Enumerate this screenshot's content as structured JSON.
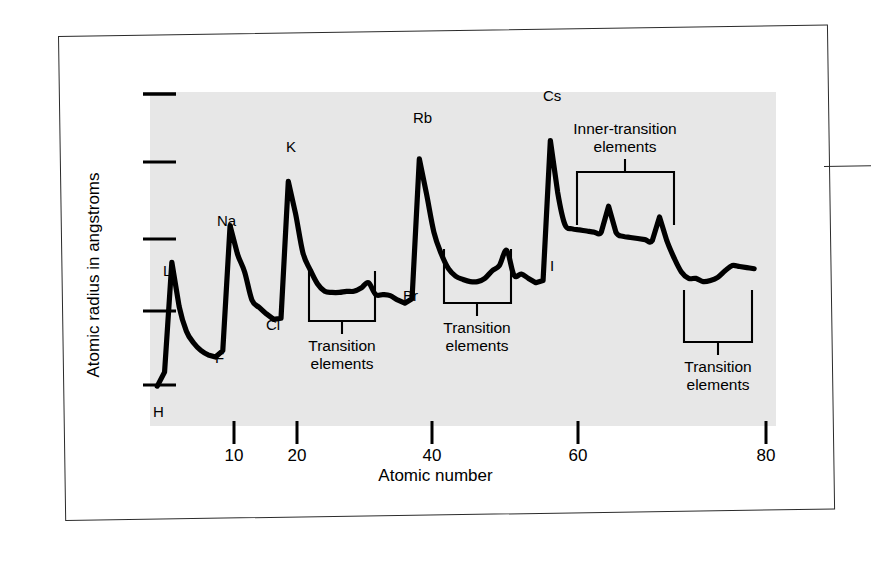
{
  "figure": {
    "y_axis_title": "Atomic radius in angstroms",
    "x_axis_title": "Atomic number",
    "plot_background_color": "#e7e7e7",
    "curve_color": "#000000",
    "frame_color": "#2b2b2b"
  },
  "chart_data": {
    "type": "line",
    "title": "",
    "subtitle": "",
    "xlabel": "Atomic number",
    "ylabel": "Atomic radius in angstroms",
    "xlim": [
      0,
      86
    ],
    "ylim": [
      0,
      3.1
    ],
    "grid": false,
    "legend": null,
    "x_ticks": [
      10,
      20,
      40,
      60,
      80
    ],
    "x_tick_labels": [
      "10",
      "20",
      "40",
      "60",
      "80"
    ],
    "y_ticks": [
      0.5,
      1.0,
      1.5,
      2.0,
      2.5
    ],
    "y_tick_labels": [
      "",
      "",
      "",
      "",
      ""
    ],
    "series": [
      {
        "name": "Atomic radius",
        "x": [
          1,
          2,
          3,
          4,
          5,
          6,
          7,
          8,
          9,
          10,
          11,
          12,
          13,
          14,
          15,
          16,
          17,
          18,
          19,
          20,
          21,
          22,
          23,
          24,
          25,
          26,
          27,
          28,
          29,
          30,
          31,
          32,
          33,
          34,
          35,
          36,
          37,
          38,
          39,
          40,
          41,
          42,
          43,
          44,
          45,
          46,
          47,
          48,
          49,
          50,
          51,
          52,
          53,
          54,
          55,
          56,
          57,
          58,
          59,
          60,
          61,
          62,
          63,
          64,
          65,
          66,
          67,
          68,
          69,
          70,
          71,
          72,
          73,
          74,
          75,
          76,
          77,
          78,
          79,
          80,
          81,
          82,
          83
        ],
        "y": [
          0.37,
          0.5,
          1.52,
          1.11,
          0.88,
          0.77,
          0.7,
          0.66,
          0.64,
          0.7,
          1.86,
          1.6,
          1.43,
          1.17,
          1.1,
          1.04,
          0.99,
          1.0,
          2.27,
          1.97,
          1.61,
          1.45,
          1.32,
          1.25,
          1.24,
          1.24,
          1.25,
          1.25,
          1.28,
          1.33,
          1.22,
          1.22,
          1.21,
          1.17,
          1.14,
          1.18,
          2.48,
          2.15,
          1.8,
          1.6,
          1.46,
          1.39,
          1.36,
          1.34,
          1.34,
          1.37,
          1.44,
          1.49,
          1.63,
          1.4,
          1.41,
          1.37,
          1.33,
          1.35,
          2.65,
          2.17,
          1.87,
          1.83,
          1.82,
          1.81,
          1.8,
          1.8,
          2.04,
          1.8,
          1.76,
          1.75,
          1.74,
          1.73,
          1.72,
          1.94,
          1.72,
          1.56,
          1.43,
          1.37,
          1.37,
          1.34,
          1.35,
          1.38,
          1.44,
          1.49,
          1.48,
          1.47,
          1.46
        ]
      }
    ],
    "point_labels": [
      {
        "text": "H",
        "atomic_number": 1,
        "position": "below"
      },
      {
        "text": "Li",
        "atomic_number": 3,
        "position": "above"
      },
      {
        "text": "F",
        "atomic_number": 9,
        "position": "below"
      },
      {
        "text": "Na",
        "atomic_number": 11,
        "position": "above"
      },
      {
        "text": "Cl",
        "atomic_number": 17,
        "position": "below"
      },
      {
        "text": "K",
        "atomic_number": 19,
        "position": "above"
      },
      {
        "text": "Br",
        "atomic_number": 35,
        "position": "below"
      },
      {
        "text": "Rb",
        "atomic_number": 37,
        "position": "above"
      },
      {
        "text": "I",
        "atomic_number": 53,
        "position": "below"
      },
      {
        "text": "Cs",
        "atomic_number": 55,
        "position": "above"
      }
    ],
    "annotations": [
      {
        "id": "bracket-1",
        "text": "Transition\nelements",
        "line1": "Transition",
        "line2": "elements",
        "x_start": 21,
        "x_end": 30
      },
      {
        "id": "bracket-2",
        "text": "Transition\nelements",
        "line1": "Transition",
        "line2": "elements",
        "x_start": 39,
        "x_end": 48
      },
      {
        "id": "bracket-3",
        "text": "Inner-transition\nelements",
        "line1": "Inner-transition",
        "line2": "elements",
        "x_start": 57,
        "x_end": 70
      },
      {
        "id": "bracket-4",
        "text": "Transition\nelements",
        "line1": "Transition",
        "line2": "elements",
        "x_start": 71,
        "x_end": 80
      }
    ]
  }
}
